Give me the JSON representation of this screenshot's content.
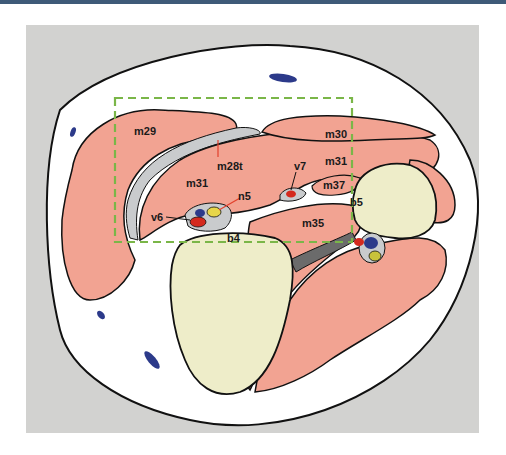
{
  "figure": {
    "type": "cross-sectional anatomical illustration",
    "colors": {
      "frame_bar": "#3e5a78",
      "background_panel": "#d2d2d0",
      "skin": "#ffffff",
      "muscle": "#f2a392",
      "bone": "#eeedc9",
      "fascia": "#c9cbcd",
      "artery": "#d42a1e",
      "vein": "#2c3a8a",
      "nerve": "#c8c23a",
      "roi_box": "#7ab648",
      "pointer_line": "#e2402c"
    },
    "region_of_interest": {
      "style": "dashed green rectangle"
    },
    "labels": {
      "m29": "m29",
      "m28t": "m28t",
      "m30": "m30",
      "m31a": "m31",
      "m31b": "m31",
      "m37": "m37",
      "v7": "v7",
      "n5": "n5",
      "v6": "v6",
      "b5": "b5",
      "b4": "b4",
      "m35": "m35"
    }
  }
}
